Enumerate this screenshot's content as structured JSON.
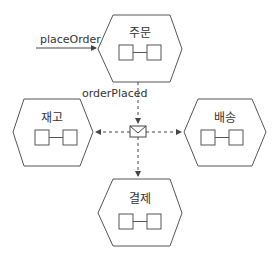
{
  "diagram": {
    "type": "event-driven hexagonal services",
    "services": [
      {
        "id": "order",
        "label": "주문"
      },
      {
        "id": "inventory",
        "label": "재고"
      },
      {
        "id": "shipping",
        "label": "배송"
      },
      {
        "id": "payment",
        "label": "결제"
      }
    ],
    "edges": [
      {
        "label": "placeOrder",
        "from": "external",
        "to": "order",
        "style": "solid"
      },
      {
        "label": "orderPlaced",
        "from": "order",
        "to": "message-channel",
        "style": "dashed"
      },
      {
        "label": "",
        "from": "message-channel",
        "to": "inventory",
        "style": "dashed"
      },
      {
        "label": "",
        "from": "message-channel",
        "to": "shipping",
        "style": "dashed"
      },
      {
        "label": "",
        "from": "message-channel",
        "to": "payment",
        "style": "dashed"
      }
    ],
    "message_icon": "envelope-icon",
    "colors": {
      "stroke": "#444444",
      "text": "#333333",
      "background": "#ffffff"
    }
  }
}
